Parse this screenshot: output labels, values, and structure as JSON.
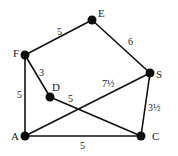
{
  "graph": {
    "nodes": [
      {
        "id": "E",
        "label": "E",
        "x": 92,
        "y": 20,
        "lx": 98,
        "ly": 17
      },
      {
        "id": "F",
        "label": "F",
        "x": 25,
        "y": 55,
        "lx": 13,
        "ly": 57
      },
      {
        "id": "D",
        "label": "D",
        "x": 50,
        "y": 97,
        "lx": 52,
        "ly": 91
      },
      {
        "id": "S",
        "label": "S",
        "x": 150,
        "y": 73,
        "lx": 156,
        "ly": 78
      },
      {
        "id": "A",
        "label": "A",
        "x": 25,
        "y": 136,
        "lx": 11,
        "ly": 140
      },
      {
        "id": "C",
        "label": "C",
        "x": 141,
        "y": 136,
        "lx": 152,
        "ly": 140
      }
    ],
    "edges": [
      {
        "from": "F",
        "to": "E",
        "weight": "5",
        "lx": 57,
        "ly": 35
      },
      {
        "from": "E",
        "to": "S",
        "weight": "6",
        "lx": 128,
        "ly": 45
      },
      {
        "from": "F",
        "to": "D",
        "weight": "3",
        "lx": 39,
        "ly": 76
      },
      {
        "from": "F",
        "to": "A",
        "weight": "5",
        "lx": 17,
        "ly": 98
      },
      {
        "from": "D",
        "to": "C",
        "weight": "5",
        "lx": 68,
        "ly": 102
      },
      {
        "from": "A",
        "to": "S",
        "weight": "7½",
        "lx": 102,
        "ly": 87
      },
      {
        "from": "S",
        "to": "C",
        "weight": "3½",
        "lx": 148,
        "ly": 111
      },
      {
        "from": "A",
        "to": "C",
        "weight": "5",
        "lx": 80,
        "ly": 149
      }
    ],
    "colors": {
      "edge": "#111111",
      "node": "#0d0d0d",
      "text": "#222222",
      "background": "#ffffff"
    }
  }
}
